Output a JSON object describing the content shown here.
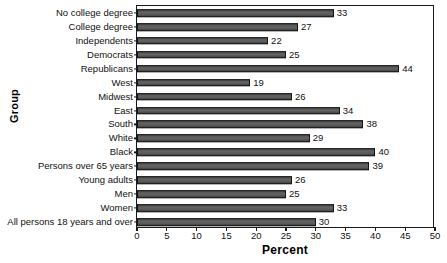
{
  "chart_data": {
    "type": "bar",
    "orientation": "horizontal",
    "title": "",
    "xlabel": "Percent",
    "ylabel": "Group",
    "xlim": [
      0,
      50
    ],
    "xticks": [
      0,
      5,
      10,
      15,
      20,
      25,
      30,
      35,
      40,
      45,
      50
    ],
    "grid": false,
    "legend": false,
    "bar_color": "#595959",
    "bar_edge_color": "#141414",
    "categories": [
      "No college degree",
      "College degree",
      "Independents",
      "Democrats",
      "Republicans",
      "West",
      "Midwest",
      "East",
      "South",
      "White",
      "Black",
      "Persons over 65 years",
      "Young adults",
      "Men",
      "Women",
      "All persons 18 years and over"
    ],
    "values": [
      33,
      27,
      22,
      25,
      44,
      19,
      26,
      34,
      38,
      29,
      40,
      39,
      26,
      25,
      33,
      30
    ],
    "value_labels": [
      "33",
      "27",
      "22",
      "25",
      "44",
      "19",
      "26",
      "34",
      "38",
      "29",
      "40",
      "39",
      "26",
      "25",
      "33",
      "30"
    ]
  }
}
